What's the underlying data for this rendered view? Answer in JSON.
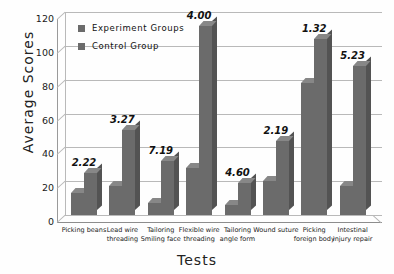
{
  "chart_data": {
    "type": "bar",
    "title": "",
    "xlabel": "Tests",
    "ylabel": "Average Scores",
    "ylim": [
      0,
      120
    ],
    "yticks": [
      0,
      20,
      40,
      60,
      80,
      100,
      120
    ],
    "grid": true,
    "legend_position": "top-left",
    "style": "3d-clustered-column",
    "categories": [
      "Picking beans",
      "Lead wire threading",
      "Tailoring Smiling face",
      "Flexible wire threading",
      "Tailoring angle form",
      "Wound suture",
      "Picking foreign body",
      "Intestinal injury repair"
    ],
    "series": [
      {
        "name": "Experiment Groups",
        "values": [
          13,
          17,
          7,
          28,
          6,
          20,
          78,
          17
        ]
      },
      {
        "name": "Control Group",
        "values": [
          25,
          50,
          32,
          112,
          19,
          44,
          104,
          88
        ]
      }
    ],
    "annotations": [
      "2.22",
      "3.27",
      "7.19",
      "4.00",
      "4.60",
      "2.19",
      "1.32",
      "5.23"
    ],
    "colors": {
      "experiment": "#6b6b6b",
      "control": "#6b6b6b",
      "grid": "#b9b9b9",
      "axis": "#8d8d8d",
      "background": "#fefefe",
      "text": "#1a1a1a"
    }
  },
  "axis": {
    "ylabel": "Average Scores",
    "xlabel": "Tests",
    "yticks": [
      "120",
      "100",
      "80",
      "60",
      "40",
      "20",
      "0"
    ]
  },
  "legend": {
    "items": [
      {
        "label": "Experiment Groups"
      },
      {
        "label": "Control Group"
      }
    ]
  },
  "xcats": [
    {
      "line1": "Picking beans",
      "line2": ""
    },
    {
      "line1": "Lead wire",
      "line2": "threading"
    },
    {
      "line1": "Tailoring",
      "line2": "Smiling face"
    },
    {
      "line1": "Flexible wire",
      "line2": "threading"
    },
    {
      "line1": "Tailoring",
      "line2": "angle form"
    },
    {
      "line1": "Wound suture",
      "line2": ""
    },
    {
      "line1": "Picking",
      "line2": "foreign body"
    },
    {
      "line1": "Intestinal",
      "line2": "injury repair"
    }
  ]
}
